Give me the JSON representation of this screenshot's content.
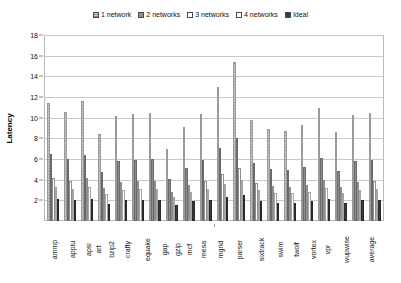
{
  "chart_data": {
    "type": "bar",
    "title": "",
    "xlabel": "",
    "ylabel": "Latency",
    "ylim": [
      0,
      18
    ],
    "yticks": [
      0,
      2,
      4,
      6,
      8,
      10,
      12,
      14,
      16,
      18
    ],
    "ytick_labels": [
      "",
      "2",
      "4",
      "6",
      "8",
      "10",
      "12",
      "14",
      "16",
      "18"
    ],
    "grid": true,
    "legend_position": "top-center",
    "categories": [
      "ammp",
      "applu",
      "apsi",
      "art",
      "bzip2",
      "crafty",
      "equake",
      "gap",
      "gzip",
      "mcf",
      "mesa",
      "mgrid",
      "parser",
      "sixtrack",
      "swim",
      "twolf",
      "vortex",
      "vpr",
      "wupwise",
      "average"
    ],
    "series": [
      {
        "name": "1 network",
        "color": "#c8c8c8",
        "values": [
          11.5,
          10.6,
          11.7,
          8.5,
          10.2,
          10.4,
          10.5,
          7.0,
          9.1,
          10.4,
          13.0,
          15.5,
          9.8,
          9.0,
          8.8,
          9.3,
          11.0,
          8.7,
          10.3,
          10.5
        ]
      },
      {
        "name": "2 networks",
        "color": "#8e8e8e",
        "values": [
          6.5,
          6.0,
          6.4,
          4.8,
          5.8,
          5.9,
          6.0,
          4.1,
          5.2,
          5.9,
          7.1,
          8.1,
          5.6,
          5.1,
          5.0,
          5.3,
          6.1,
          4.9,
          5.8,
          5.9
        ]
      },
      {
        "name": "3 networks",
        "color": "#ffffff",
        "values": [
          4.2,
          3.9,
          4.2,
          3.2,
          3.8,
          3.9,
          3.9,
          2.8,
          3.5,
          3.9,
          4.6,
          5.2,
          3.7,
          3.4,
          3.3,
          3.5,
          4.0,
          3.3,
          3.8,
          3.9
        ]
      },
      {
        "name": "4 networks",
        "color": "#ffffff",
        "values": [
          3.3,
          3.1,
          3.3,
          2.6,
          3.0,
          3.1,
          3.1,
          2.3,
          2.8,
          3.1,
          3.6,
          4.0,
          3.0,
          2.7,
          2.7,
          2.8,
          3.2,
          2.7,
          3.0,
          3.1
        ]
      },
      {
        "name": "Ideal",
        "color": "#3b3b3b",
        "values": [
          2.1,
          2.0,
          2.1,
          1.7,
          2.0,
          2.0,
          2.0,
          1.6,
          1.9,
          2.0,
          2.3,
          2.5,
          1.9,
          1.8,
          1.8,
          1.9,
          2.1,
          1.8,
          2.0,
          2.0
        ]
      }
    ]
  },
  "legend": {
    "items": [
      {
        "label": "1 network",
        "swatch_class": "sw-s0"
      },
      {
        "label": "2 networks",
        "swatch_class": "sw-s1"
      },
      {
        "label": "3 networks",
        "swatch_class": "sw-s2"
      },
      {
        "label": "4 networks",
        "swatch_class": "sw-s3"
      },
      {
        "label": "Ideal",
        "swatch_class": "sw-s4"
      }
    ]
  },
  "axis": {
    "y_title": "Latency"
  }
}
